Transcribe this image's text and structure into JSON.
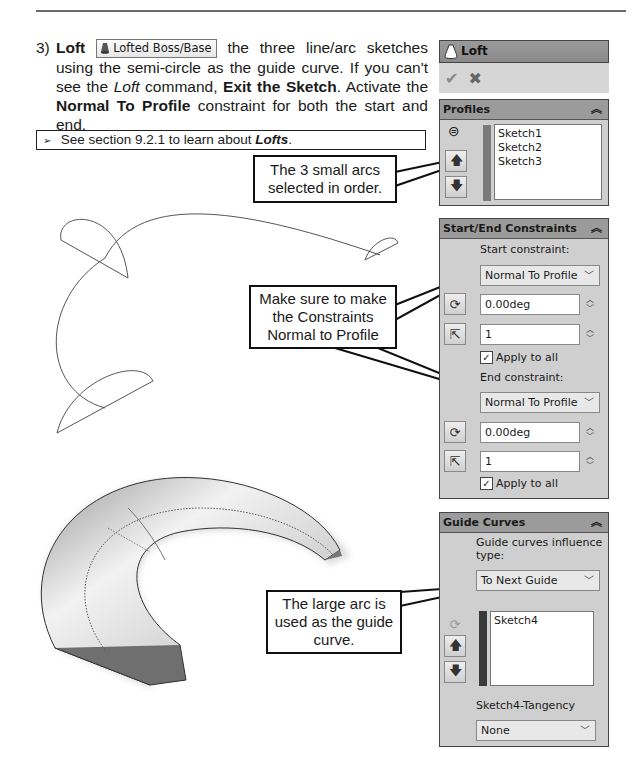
{
  "header": {
    "text": "Learning SOLIDWORKS"
  },
  "step": {
    "number": "3)",
    "bold_lead": "Loft",
    "command_button": {
      "label": "Lofted Boss/Base",
      "icon": "loft-icon"
    },
    "text_1": " the three line/arc sketches using the semi-circle as the guide curve.  If you can't see the ",
    "italic_1": "Loft",
    "text_2": " command, ",
    "bold_2": "Exit the Sketch",
    "text_3": ".  Activate the ",
    "bold_3": "Normal To Profile",
    "text_4": " constraint for both the start and end."
  },
  "note": {
    "prefix": "See section 9.2.1 to learn about ",
    "bold_italic": "Lofts",
    "suffix": "."
  },
  "callouts": {
    "profiles": "The 3 small arcs selected in order.",
    "constraints": "Make sure to make the Constraints Normal to Profile",
    "guide": "The large arc is used as the guide curve."
  },
  "property_manager": {
    "title": "Loft",
    "actions": {
      "ok": "✔",
      "cancel": "✖"
    },
    "profiles": {
      "title": "Profiles",
      "items": [
        "Sketch1",
        "Sketch2",
        "Sketch3"
      ],
      "bar_color": "#7a7a7a"
    },
    "start_end": {
      "title": "Start/End Constraints",
      "start_label": "Start constraint:",
      "start_value": "Normal To Profile",
      "start_angle": "0.00deg",
      "start_length": "1",
      "start_apply_all": "Apply to all",
      "end_label": "End constraint:",
      "end_value": "Normal To Profile",
      "end_angle": "0.00deg",
      "end_length": "1",
      "end_apply_all": "Apply to all"
    },
    "guide_curves": {
      "title": "Guide Curves",
      "influence_label": "Guide curves influence type:",
      "influence_value": "To Next Guide",
      "items": [
        "Sketch4"
      ],
      "bar_color": "#3a3a3a",
      "tangency_label": "Sketch4-Tangency",
      "tangency_value": "None"
    }
  }
}
